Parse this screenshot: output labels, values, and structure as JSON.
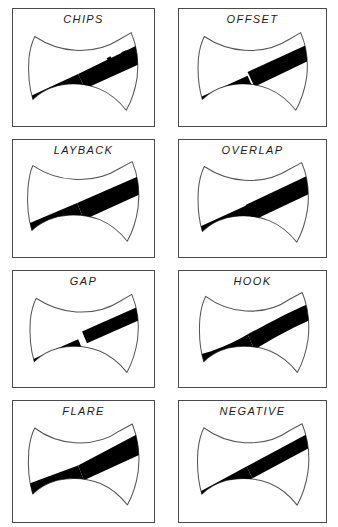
{
  "figure": {
    "columns": 2,
    "rows": 4,
    "panel_count": 8,
    "background_color": "#ffffff",
    "border_color": "#4a4a4a",
    "band_color": "#000000",
    "outline_color": "#555555",
    "label_color": "#1b1b1b",
    "label_style": "italic uppercase sans-serif, letter-spaced"
  },
  "panels": [
    {
      "index": 1,
      "label": "CHIPS",
      "row": 1,
      "column": 1,
      "icon": "axe-head-icon",
      "description": "Double-bit axe head with diagonal black band; band edges are ragged and chipped along the upper right segment.",
      "band_angle_deg": -25,
      "band_width": "wide",
      "band_style": "ragged-chipped",
      "halves_aligned": true
    },
    {
      "index": 2,
      "label": "OFFSET",
      "row": 1,
      "column": 2,
      "icon": "axe-head-icon",
      "description": "Double-bit axe head with diagonal black band; the two halves of the band are shifted laterally relative to each other.",
      "band_angle_deg": -25,
      "band_width": "wide",
      "band_style": "straight",
      "halves_aligned": false
    },
    {
      "index": 3,
      "label": "LAYBACK",
      "row": 2,
      "column": 1,
      "icon": "axe-head-icon",
      "description": "Double-bit axe head with diagonal black band laid back at a shallower angle across the head.",
      "band_angle_deg": -22,
      "band_width": "wide",
      "band_style": "straight",
      "halves_aligned": true
    },
    {
      "index": 4,
      "label": "OVERLAP",
      "row": 2,
      "column": 2,
      "icon": "axe-head-icon",
      "description": "Double-bit axe head with diagonal black band whose two halves overlap at the centre junction.",
      "band_angle_deg": -25,
      "band_width": "wide",
      "band_style": "straight",
      "halves_aligned": true
    },
    {
      "index": 5,
      "label": "GAP",
      "row": 3,
      "column": 1,
      "icon": "axe-head-icon",
      "description": "Double-bit axe head with diagonal black band broken by a white gap between the two halves at the centre.",
      "band_angle_deg": -25,
      "band_width": "medium",
      "band_style": "gapped",
      "halves_aligned": false
    },
    {
      "index": 6,
      "label": "HOOK",
      "row": 3,
      "column": 2,
      "icon": "axe-head-icon",
      "description": "Double-bit axe head with a curved, hooked black band bowing upward toward the right bit.",
      "band_angle_deg": -25,
      "band_width": "wide",
      "band_style": "curved-hooked",
      "halves_aligned": true
    },
    {
      "index": 7,
      "label": "FLARE",
      "row": 4,
      "column": 1,
      "icon": "axe-head-icon",
      "description": "Double-bit axe head with a black band that flares wider toward the outer ends.",
      "band_angle_deg": -25,
      "band_width": "flared",
      "band_style": "flared",
      "halves_aligned": true
    },
    {
      "index": 8,
      "label": "NEGATIVE",
      "row": 4,
      "column": 2,
      "icon": "axe-head-icon",
      "description": "Double-bit axe head with a narrow black band set at a steeper negative angle across the head.",
      "band_angle_deg": -30,
      "band_width": "narrow",
      "band_style": "straight-steep",
      "halves_aligned": true
    }
  ]
}
